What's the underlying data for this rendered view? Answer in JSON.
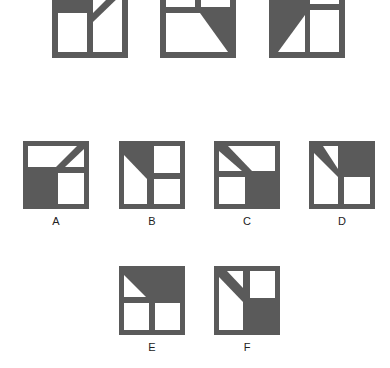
{
  "puzzle": {
    "colors": {
      "frame": "#5a5a5a",
      "fill": "#5a5a5a",
      "background": "#ffffff"
    },
    "sequence": [
      {
        "id": "seq-1",
        "description": "top-left shaded, diagonal in top-right"
      },
      {
        "id": "seq-2",
        "description": "bottom-right shaded trapezoid with diagonal"
      },
      {
        "id": "seq-3",
        "description": "left column shaded with white triangle bottom-left"
      }
    ],
    "options": [
      {
        "label": "A"
      },
      {
        "label": "B"
      },
      {
        "label": "C"
      },
      {
        "label": "D"
      },
      {
        "label": "E"
      },
      {
        "label": "F"
      }
    ]
  }
}
